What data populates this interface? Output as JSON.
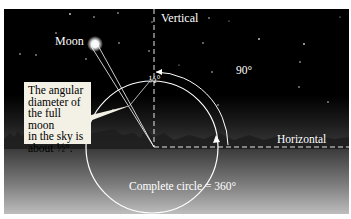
{
  "labels": {
    "moon": "Moon",
    "vertical": "Vertical",
    "horizontal": "Horizontal",
    "right_angle": "90°",
    "half_degree": "½°",
    "complete_circle": "Complete circle = 360°"
  },
  "callout": {
    "lines": [
      "The angular",
      "diameter of",
      "the full moon",
      "in the sky is",
      "about ½°."
    ]
  },
  "colors": {
    "sky_top": "#000000",
    "ground_bottom": "#bdbdbd",
    "callout_bg": "#f3f0e6",
    "line": "#ffffff"
  }
}
